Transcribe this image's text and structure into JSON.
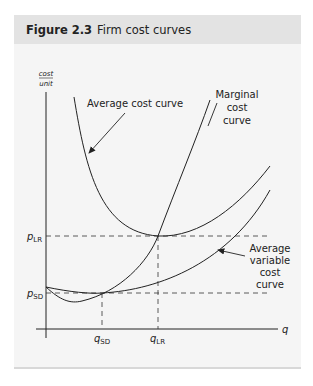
{
  "figure": {
    "number": "Figure 2.3",
    "title": "Firm cost curves"
  },
  "axes": {
    "y_label_top": "cost",
    "y_label_bottom": "unit",
    "x_label": "q"
  },
  "labels": {
    "average_cost": "Average cost curve",
    "marginal_1": "Marginal",
    "marginal_2": "cost",
    "marginal_3": "curve",
    "avc_1": "Average",
    "avc_2": "variable",
    "avc_3": "cost",
    "avc_4": "curve"
  },
  "ticks": {
    "p_lr": "p",
    "p_lr_sub": "LR",
    "p_sd": "p",
    "p_sd_sub": "SD",
    "q_sd": "q",
    "q_sd_sub": "SD",
    "q_lr": "q",
    "q_lr_sub": "LR"
  },
  "colors": {
    "header_bg": "#e3e3e3",
    "panel_bg": "#f5f5f5",
    "line": "#222222"
  }
}
